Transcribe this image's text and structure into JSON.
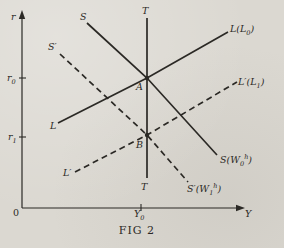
{
  "colors": {
    "paper": "#dbd8d1",
    "ink": "#2b2925"
  },
  "figure": {
    "caption": "FIG 2",
    "axis": {
      "vertical_label": "r",
      "horizontal_label": "Y",
      "origin": "0",
      "ticks": {
        "r0": {
          "base": "r",
          "sub": "0"
        },
        "r1": {
          "base": "r",
          "sub": "1"
        },
        "y0": {
          "base": "Y",
          "sub": "0"
        }
      }
    },
    "labels": {
      "s_top": "S",
      "s_prime_top": "S′",
      "t_top": "T",
      "t_bottom": "T",
      "l_left": "L",
      "l_prime_left": "L′",
      "point_a": "A",
      "point_b": "B",
      "l_right": {
        "pre": "L(L",
        "sub": "0",
        "post": ")"
      },
      "l_prime_right": {
        "pre": "L′(L",
        "sub": "1",
        "post": ")"
      },
      "s_right": {
        "pre": "S(W",
        "sub": "0",
        "sup": "h",
        "post": ")"
      },
      "s_prime_right": {
        "pre": "S′(W",
        "sub": "1",
        "sup": "h",
        "post": ")"
      }
    }
  },
  "geometry": {
    "y_axis": {
      "points": "22,208 22,16"
    },
    "x_axis": {
      "points": "22,208 240,208"
    },
    "y_axis_arrow": {
      "points": "22,10 18.8,19 25.2,19"
    },
    "x_axis_arrow": {
      "points": "245,208 236,204.8 236,211.2"
    },
    "t_line": {
      "points": "147,18 147,178"
    },
    "s_line": {
      "points": "87,23 147,78 217,155"
    },
    "s_prime_line": {
      "points": "60,54 147,135 188,182"
    },
    "l_line": {
      "points": "58,123 147,78 228,32"
    },
    "l_prime_line": {
      "points": "75,172 147,135 237,82"
    },
    "tick_r0": {
      "points": "19,78 26,78"
    },
    "tick_r1": {
      "points": "19,137 26,137"
    },
    "tick_y0": {
      "points": "141,204 141,211"
    },
    "point_a": {
      "cx": "147",
      "cy": "78"
    },
    "point_b": {
      "cx": "147",
      "cy": "135"
    }
  }
}
